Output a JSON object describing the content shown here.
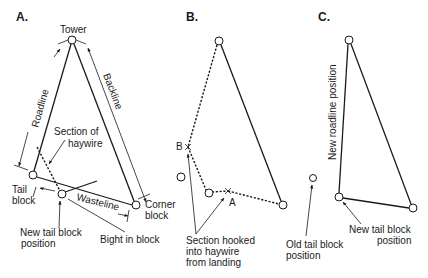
{
  "panels": {
    "a": {
      "label": "A.",
      "tower": "Tower",
      "roadline": "Roadline",
      "backline": "Backline",
      "section_of": "Section of",
      "haywire": "haywire",
      "tail": "Tail",
      "block": "block",
      "corner": "Corner",
      "corner_block": "block",
      "wasteline": "Wasteline",
      "new_tail_1": "New tail block",
      "new_tail_2": "position",
      "bight": "Bight in block"
    },
    "b": {
      "label": "B.",
      "point_b": "B",
      "point_a": "A",
      "section_1": "Section hooked",
      "section_2": "into haywire",
      "section_3": "from landing"
    },
    "c": {
      "label": "C.",
      "new_roadline": "New roadline position",
      "old_tail_1": "Old tail block",
      "old_tail_2": "position",
      "new_tail_1": "New tail block",
      "new_tail_2": "position"
    }
  },
  "colors": {
    "ink": "#1a1a1a",
    "background": "#ffffff"
  }
}
